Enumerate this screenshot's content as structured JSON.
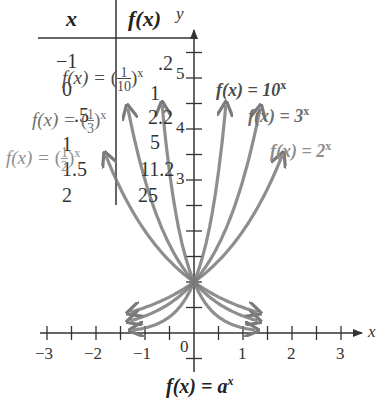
{
  "table": {
    "header_x": "x",
    "header_fx": "f(x)",
    "rows": [
      {
        "x": "−1",
        "fx": ".2"
      },
      {
        "x": "0",
        "fx": "1"
      },
      {
        "x": ".5",
        "fx": "2.2"
      },
      {
        "x": "1",
        "fx": "5"
      },
      {
        "x": "1.5",
        "fx": "11.2"
      },
      {
        "x": "2",
        "fx": "25"
      }
    ]
  },
  "labels": {
    "ten": {
      "base": "f(x) = 10",
      "exp": "x"
    },
    "three": {
      "base": "f(x) = 3",
      "exp": "x"
    },
    "two": {
      "base": "f(x) = 2",
      "exp": "x"
    },
    "tenth": {
      "prefix": "f(x) = ",
      "num": "1",
      "den": "10",
      "exp": "x"
    },
    "third": {
      "prefix": "f(x) = ",
      "num": "1",
      "den": "3",
      "exp": "x"
    },
    "half": {
      "prefix": "f(x) = ",
      "num": "1",
      "den": "2",
      "exp": "x"
    }
  },
  "axes": {
    "x_label": "x",
    "y_label": "y",
    "x_ticks": [
      "−3",
      "−2",
      "−1",
      "0",
      "1",
      "2",
      "3"
    ],
    "y_ticks": [
      "3",
      "4",
      "5"
    ]
  },
  "caption": {
    "base": "f(x) = a",
    "exp": "x"
  },
  "colors": {
    "curve": "#7a7a7a",
    "label_dark": "#4a4a4a",
    "label_mid": "#6e6e6e",
    "label_light": "#8e8e8e",
    "axis": "#333333"
  },
  "chart_data": {
    "type": "line",
    "xlabel": "x",
    "ylabel": "y",
    "xlim": [
      -3,
      3
    ],
    "ylim": [
      0,
      5.5
    ],
    "grid": false,
    "series": [
      {
        "name": "f(x) = 10^x",
        "x": [
          -1.25,
          -1,
          -0.5,
          0,
          0.25,
          0.5,
          0.65
        ],
        "values": [
          0.056,
          0.1,
          0.316,
          1,
          1.778,
          3.162,
          4.467
        ]
      },
      {
        "name": "f(x) = 3^x",
        "x": [
          -1.3,
          -1,
          -0.5,
          0,
          0.5,
          1,
          1.35
        ],
        "values": [
          0.24,
          0.333,
          0.577,
          1,
          1.732,
          3,
          4.4
        ]
      },
      {
        "name": "f(x) = 2^x",
        "x": [
          -1.3,
          -1,
          -0.5,
          0,
          0.5,
          1,
          1.5,
          1.8
        ],
        "values": [
          0.406,
          0.5,
          0.707,
          1,
          1.414,
          2,
          2.828,
          3.48
        ]
      },
      {
        "name": "f(x) = (1/10)^x",
        "x": [
          -0.65,
          -0.5,
          -0.25,
          0,
          0.5,
          1,
          1.25
        ],
        "values": [
          4.467,
          3.162,
          1.778,
          1,
          0.316,
          0.1,
          0.056
        ]
      },
      {
        "name": "f(x) = (1/3)^x",
        "x": [
          -1.35,
          -1,
          -0.5,
          0,
          0.5,
          1,
          1.3
        ],
        "values": [
          4.4,
          3,
          1.732,
          1,
          0.577,
          0.333,
          0.24
        ]
      },
      {
        "name": "f(x) = (1/2)^x",
        "x": [
          -1.8,
          -1.5,
          -1,
          -0.5,
          0,
          0.5,
          1,
          1.3
        ],
        "values": [
          3.48,
          2.828,
          2,
          1.414,
          1,
          0.707,
          0.5,
          0.406
        ]
      }
    ],
    "table": {
      "columns": [
        "x",
        "f(x)"
      ],
      "rows": [
        [
          -1,
          0.2
        ],
        [
          0,
          1
        ],
        [
          0.5,
          2.2
        ],
        [
          1,
          5
        ],
        [
          1.5,
          11.2
        ],
        [
          2,
          25
        ]
      ]
    }
  }
}
